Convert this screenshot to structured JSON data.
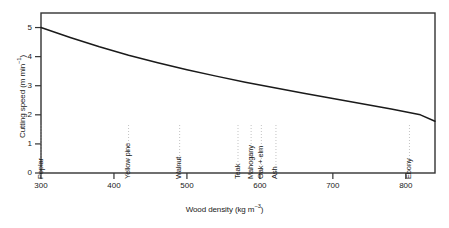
{
  "chart_data": {
    "type": "line",
    "title": "",
    "xlabel": "Wood density (kg m⁻³)",
    "ylabel": "Cutting speed (m min⁻¹)",
    "xlim": [
      300,
      840
    ],
    "ylim": [
      0,
      5.5
    ],
    "xticks": [
      300,
      400,
      500,
      600,
      700,
      800
    ],
    "xticklabels": [
      "300",
      "400",
      "500",
      "600",
      "700",
      "800"
    ],
    "yticks": [
      0,
      1,
      2,
      3,
      4,
      5
    ],
    "yticklabels": [
      "0",
      "1",
      "2",
      "3",
      "4",
      "5"
    ],
    "grid": false,
    "legend": "none",
    "series": [
      {
        "name": "Cutting speed vs wood density",
        "x": [
          300,
          340,
          380,
          420,
          460,
          500,
          540,
          580,
          620,
          660,
          700,
          740,
          780,
          820,
          840
        ],
        "y": [
          5.0,
          4.66,
          4.34,
          4.05,
          3.79,
          3.55,
          3.33,
          3.12,
          2.93,
          2.74,
          2.56,
          2.38,
          2.2,
          2.0,
          1.78
        ]
      }
    ],
    "annotations": [
      {
        "label": "Poplar",
        "x": 300
      },
      {
        "label": "Yellow pine",
        "x": 420
      },
      {
        "label": "Walnut",
        "x": 490
      },
      {
        "label": "Teak",
        "x": 570
      },
      {
        "label": "Mahogany",
        "x": 588
      },
      {
        "label": "Oak + elm",
        "x": 602
      },
      {
        "label": "Ash",
        "x": 622
      },
      {
        "label": "Ebony",
        "x": 805
      }
    ],
    "line_color": "#1a1a1a",
    "frame_color": "#333333"
  }
}
